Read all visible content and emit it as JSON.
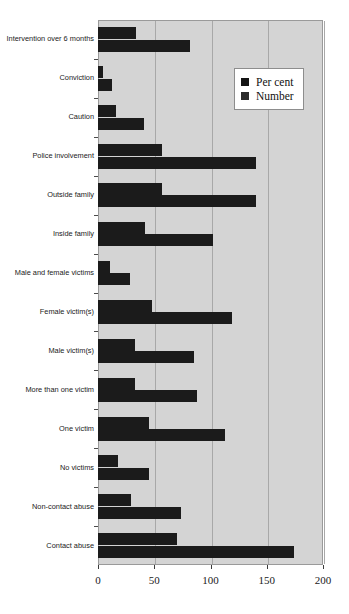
{
  "chart_data": {
    "type": "bar",
    "orientation": "horizontal",
    "title": "",
    "xlabel": "",
    "ylabel": "",
    "xlim": [
      0,
      200
    ],
    "xticks": [
      0,
      50,
      100,
      150,
      200
    ],
    "xtick_labels": [
      "0",
      "50",
      "100",
      "150",
      "200"
    ],
    "grid": true,
    "grid_axis": "x",
    "legend_position": "upper-right",
    "plot_background": "#d4d4d4",
    "bar_color": "#1b1b1b",
    "categories": [
      "Intervention over 6 months",
      "Conviction",
      "Caution",
      "Police involvement",
      "Outside family",
      "Inside family",
      "Male and female victims",
      "Female victim(s)",
      "Male victim(s)",
      "More than one victim",
      "One victim",
      "No victims",
      "Non-contact abuse",
      "Contact abuse"
    ],
    "series": [
      {
        "name": "Per cent",
        "values": [
          34,
          4,
          16,
          57,
          57,
          42,
          11,
          48,
          33,
          33,
          45,
          18,
          29,
          70
        ]
      },
      {
        "name": "Number",
        "values": [
          82,
          12,
          41,
          140,
          140,
          102,
          28,
          119,
          85,
          88,
          113,
          45,
          74,
          174
        ]
      }
    ]
  },
  "legend": {
    "items": [
      {
        "label": "Per cent",
        "swatch": "percent-swatch"
      },
      {
        "label": "Number",
        "swatch": "number-swatch"
      }
    ]
  }
}
